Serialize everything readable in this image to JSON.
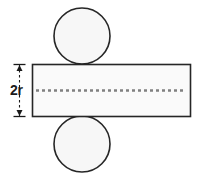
{
  "figure": {
    "name": "cylinder-net-diagram",
    "background_color": "#ffffff"
  },
  "colors": {
    "stroke": "#262626",
    "rectangle_fill": "#fafafa",
    "circle_fill": "#f7f7f7",
    "dashed_line": "#808080",
    "dimension_line": "#1a1a1a",
    "label_text": "#1a1a1a"
  },
  "labels": {
    "height_dimension": "2r"
  },
  "shapes": {
    "rectangle": {
      "name": "lateral-surface-rectangle",
      "x": 32,
      "y": 64,
      "width": 158,
      "height": 52
    },
    "top_circle": {
      "name": "top-base-circle",
      "cx": 82,
      "cy": 36,
      "r": 28
    },
    "bottom_circle": {
      "name": "bottom-base-circle",
      "cx": 82,
      "cy": 144,
      "r": 28
    },
    "center_dashed_line": {
      "name": "axis-dashed-line",
      "x1": 36,
      "x2": 186,
      "y": 90,
      "dash_pattern": "3 3"
    },
    "dimension": {
      "name": "height-dimension-2r",
      "x": 19,
      "y_top": 64,
      "y_bottom": 116,
      "tick_half_width": 6,
      "label_x": 10,
      "label_y": 95
    }
  }
}
